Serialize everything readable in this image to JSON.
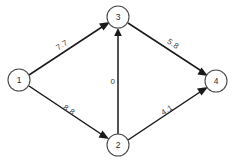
{
  "diagram": {
    "type": "directed-weighted-graph",
    "background_color": "#ffffff",
    "node_stroke_color": "#4a4a4a",
    "edge_color": "#1a1a1a",
    "label_color": "#3a3a3a",
    "nodes": [
      {
        "id": "1",
        "label": "1",
        "cx": 19,
        "cy": 80,
        "r": 11
      },
      {
        "id": "2",
        "label": "2",
        "cx": 118,
        "cy": 145,
        "r": 11
      },
      {
        "id": "3",
        "label": "3",
        "cx": 118,
        "cy": 17,
        "r": 11
      },
      {
        "id": "4",
        "label": "4",
        "cx": 216,
        "cy": 81,
        "r": 11
      }
    ],
    "edges": [
      {
        "id": "e1",
        "from": "1",
        "to": "3",
        "weight": "7.7",
        "label_x": 62,
        "label_y": 45,
        "label_rotation": -33
      },
      {
        "id": "e2",
        "from": "1",
        "to": "2",
        "weight": "8.8",
        "label_x": 69,
        "label_y": 110,
        "label_rotation": 33
      },
      {
        "id": "e3",
        "from": "2",
        "to": "3",
        "weight": "0",
        "label_x": 113,
        "label_y": 81,
        "label_rotation": 0
      },
      {
        "id": "e4",
        "from": "3",
        "to": "4",
        "weight": "5.8",
        "label_x": 173,
        "label_y": 44,
        "label_rotation": 33
      },
      {
        "id": "e5",
        "from": "2",
        "to": "4",
        "weight": "4.1",
        "label_x": 167,
        "label_y": 110,
        "label_rotation": -33
      }
    ]
  }
}
